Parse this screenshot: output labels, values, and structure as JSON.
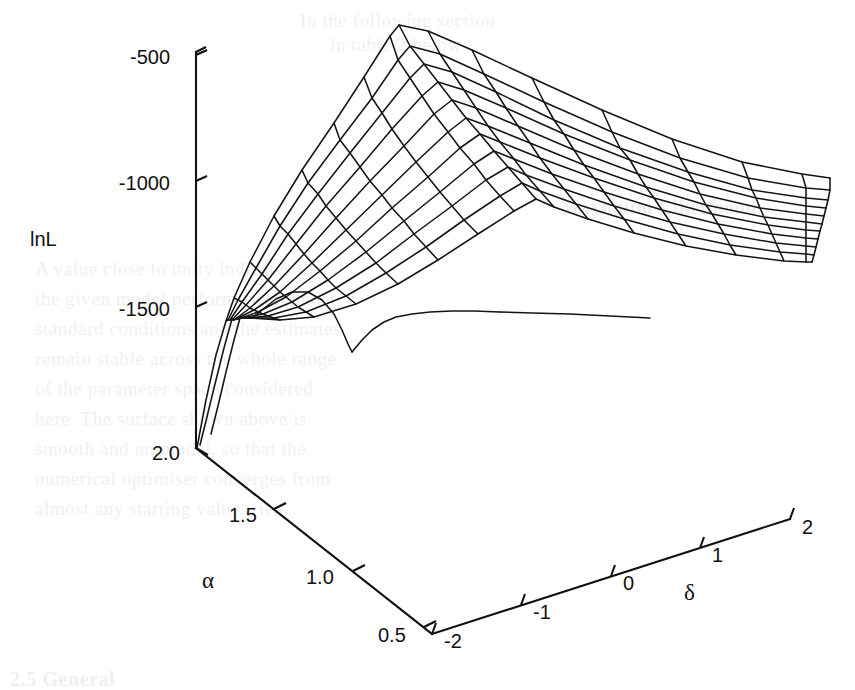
{
  "figure": {
    "kind": "3d-wireframe-surface",
    "background_color": "#ffffff",
    "line_color": "#141414"
  },
  "axes": {
    "z": {
      "label": "lnL",
      "ticks": [
        "-500",
        "-1000",
        "-1500"
      ],
      "tick_values": [
        -500,
        -1000,
        -1500
      ],
      "range": [
        -1750,
        -375
      ]
    },
    "x": {
      "label": "α",
      "ticks": [
        "2.0",
        "1.5",
        "1.0",
        "0.5"
      ],
      "tick_values": [
        2.0,
        1.5,
        1.0,
        0.5
      ],
      "range": [
        0.4,
        2.1
      ]
    },
    "y": {
      "label": "δ",
      "ticks": [
        "-2",
        "-1",
        "0",
        "1",
        "2"
      ],
      "tick_values": [
        -2,
        -1,
        0,
        1,
        2
      ],
      "range": [
        -2,
        2
      ]
    }
  },
  "chart_data": {
    "type": "surface",
    "title": "",
    "subtitle": "",
    "xlabel": "α",
    "ylabel": "δ",
    "zlabel": "lnL",
    "xlim": [
      0.4,
      2.1
    ],
    "ylim": [
      -2,
      2
    ],
    "zlim": [
      -1750,
      -375
    ],
    "grid": false,
    "legend": "none",
    "x": [
      0.4,
      0.55,
      0.7,
      0.85,
      1.0,
      1.15,
      1.3,
      1.45,
      1.6,
      1.75,
      1.9,
      2.05
    ],
    "y": [
      -2.0,
      -1.6,
      -1.2,
      -0.8,
      -0.4,
      0.0,
      0.4,
      0.8,
      1.2,
      1.6,
      2.0
    ],
    "z_description": "Log-likelihood surface lnL(alpha, delta); single broad maximum near alpha ~ 1.0-1.2 and delta ~ -1.2, falling steeply toward small alpha and decaying slowly toward large delta.",
    "z": [
      [
        -1680,
        -1600,
        -1545,
        -1520,
        -1530,
        -1565,
        -1610,
        -1655,
        -1700,
        -1735,
        -1760
      ],
      [
        -1430,
        -1330,
        -1255,
        -1215,
        -1215,
        -1250,
        -1305,
        -1370,
        -1430,
        -1480,
        -1520
      ],
      [
        -1180,
        -1060,
        -975,
        -930,
        -930,
        -970,
        -1035,
        -1110,
        -1180,
        -1240,
        -1290
      ],
      [
        -980,
        -845,
        -750,
        -700,
        -700,
        -745,
        -820,
        -900,
        -980,
        -1045,
        -1100
      ],
      [
        -835,
        -690,
        -590,
        -538,
        -540,
        -590,
        -670,
        -755,
        -840,
        -910,
        -968
      ],
      [
        -760,
        -605,
        -500,
        -448,
        -452,
        -505,
        -590,
        -680,
        -768,
        -842,
        -902
      ],
      [
        -745,
        -590,
        -485,
        -432,
        -438,
        -494,
        -582,
        -676,
        -766,
        -842,
        -904
      ],
      [
        -782,
        -628,
        -524,
        -472,
        -480,
        -538,
        -628,
        -724,
        -816,
        -892,
        -955
      ],
      [
        -850,
        -700,
        -598,
        -548,
        -558,
        -618,
        -710,
        -806,
        -898,
        -974,
        -1036
      ],
      [
        -935,
        -790,
        -692,
        -644,
        -656,
        -718,
        -810,
        -906,
        -996,
        -1072,
        -1132
      ],
      [
        -1025,
        -886,
        -792,
        -747,
        -760,
        -823,
        -915,
        -1010,
        -1100,
        -1174,
        -1232
      ],
      [
        -1115,
        -982,
        -892,
        -850,
        -864,
        -928,
        -1020,
        -1114,
        -1202,
        -1274,
        -1330
      ]
    ]
  },
  "ghost_text": {
    "note": "faint bleed-through from the reverse of the scanned page",
    "lines": [
      {
        "text": "In the following section",
        "x": 300,
        "y": 10
      },
      {
        "text": "in table 2 below",
        "x": 330,
        "y": 34
      },
      {
        "text": "Maximum Likelihood",
        "x": 560,
        "y": 196,
        "bold": true
      },
      {
        "text": "A value close to unity indicates that",
        "x": 35,
        "y": 258
      },
      {
        "text": "the given model performs well under",
        "x": 35,
        "y": 288
      },
      {
        "text": "standard conditions and the estimates",
        "x": 35,
        "y": 318
      },
      {
        "text": "remain stable across the whole range",
        "x": 35,
        "y": 348
      },
      {
        "text": "of the parameter space considered",
        "x": 35,
        "y": 378
      },
      {
        "text": "here. The surface shown above is",
        "x": 35,
        "y": 408
      },
      {
        "text": "smooth and unimodal, so that the",
        "x": 35,
        "y": 438
      },
      {
        "text": "numerical optimiser converges from",
        "x": 35,
        "y": 468
      },
      {
        "text": "almost any starting value tried.",
        "x": 35,
        "y": 498
      },
      {
        "text": "2.5 General",
        "x": 10,
        "y": 668,
        "bold": true
      }
    ]
  }
}
